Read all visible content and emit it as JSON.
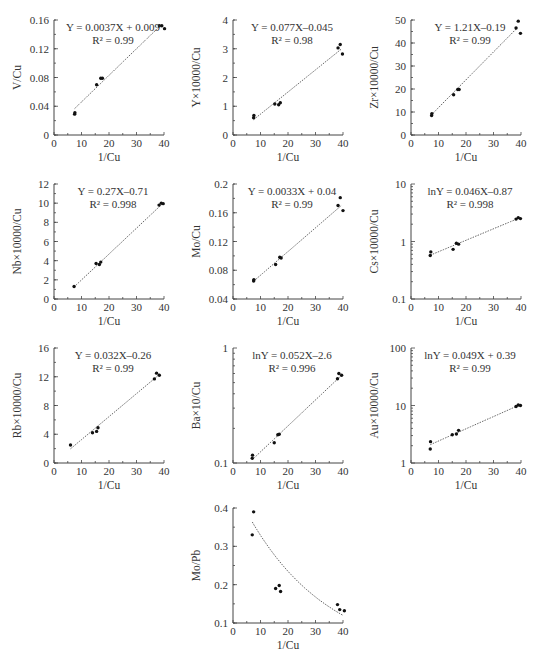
{
  "chart_data": [
    {
      "id": "v-cu",
      "type": "scatter",
      "scale": "linear",
      "xlabel": "1/Cu",
      "ylabel": "V/Cu",
      "xlim": [
        0,
        40
      ],
      "ylim": [
        0,
        0.16
      ],
      "xticks": [
        0,
        10,
        20,
        30,
        40
      ],
      "yticks": [
        0,
        0.04,
        0.08,
        0.12,
        0.16
      ],
      "ytick_labels": [
        "0",
        "0.04",
        "0.08",
        "0.12",
        "0.16"
      ],
      "equation": "Y = 0.0037X + 0.009",
      "r2": "R² = 0.99",
      "fit": {
        "kind": "linear",
        "slope": 0.0037,
        "intercept": 0.009,
        "x_range": [
          7.5,
          38.5
        ]
      },
      "points": [
        [
          7.5,
          0.029
        ],
        [
          7.6,
          0.031
        ],
        [
          15.5,
          0.07
        ],
        [
          17.0,
          0.079
        ],
        [
          17.6,
          0.079
        ],
        [
          38.3,
          0.152
        ],
        [
          39.2,
          0.152
        ],
        [
          40.2,
          0.148
        ]
      ]
    },
    {
      "id": "y-cu",
      "type": "scatter",
      "scale": "linear",
      "xlabel": "1/Cu",
      "ylabel": "Y×10000/Cu",
      "xlim": [
        0,
        40
      ],
      "ylim": [
        0,
        4
      ],
      "xticks": [
        0,
        10,
        20,
        30,
        40
      ],
      "yticks": [
        0,
        1,
        2,
        3,
        4
      ],
      "ytick_labels": [
        "0",
        "1",
        "2",
        "3",
        "4"
      ],
      "equation": "Y = 0.077X–0.045",
      "r2": "R² = 0.98",
      "fit": {
        "kind": "linear",
        "slope": 0.077,
        "intercept": -0.045,
        "x_range": [
          7.5,
          39.5
        ]
      },
      "points": [
        [
          7.5,
          0.6
        ],
        [
          7.6,
          0.68
        ],
        [
          15.2,
          1.08
        ],
        [
          16.6,
          1.05
        ],
        [
          17.2,
          1.12
        ],
        [
          38.2,
          3.03
        ],
        [
          39.0,
          3.15
        ],
        [
          39.8,
          2.82
        ]
      ]
    },
    {
      "id": "zr-cu",
      "type": "scatter",
      "scale": "linear",
      "xlabel": "1/Cu",
      "ylabel": "Zr×10000/Cu",
      "xlim": [
        0,
        40
      ],
      "ylim": [
        0,
        50
      ],
      "xticks": [
        0,
        10,
        20,
        30,
        40
      ],
      "yticks": [
        0,
        10,
        20,
        30,
        40,
        50
      ],
      "ytick_labels": [
        "0",
        "10",
        "20",
        "30",
        "40",
        "50"
      ],
      "equation": "Y = 1.21X–0.19",
      "r2": "R² = 0.99",
      "fit": {
        "kind": "linear",
        "slope": 1.21,
        "intercept": -0.19,
        "x_range": [
          7.5,
          38.5
        ]
      },
      "points": [
        [
          7.5,
          8.5
        ],
        [
          7.6,
          9.3
        ],
        [
          15.5,
          17.5
        ],
        [
          17.0,
          19.8
        ],
        [
          17.5,
          19.8
        ],
        [
          38.2,
          46.5
        ],
        [
          39.0,
          49.5
        ],
        [
          39.8,
          44.2
        ]
      ]
    },
    {
      "id": "nb-cu",
      "type": "scatter",
      "scale": "linear",
      "xlabel": "1/Cu",
      "ylabel": "Nb×10000/Cu",
      "xlim": [
        0,
        40
      ],
      "ylim": [
        0,
        12
      ],
      "xticks": [
        0,
        10,
        20,
        30,
        40
      ],
      "yticks": [
        0,
        2,
        4,
        6,
        8,
        10,
        12
      ],
      "ytick_labels": [
        "0",
        "2",
        "4",
        "6",
        "8",
        "10",
        "12"
      ],
      "equation": "Y = 0.27X–0.71",
      "r2": "R² = 0.998",
      "fit": {
        "kind": "linear",
        "slope": 0.27,
        "intercept": -0.71,
        "x_range": [
          7.3,
          39.5
        ]
      },
      "points": [
        [
          7.3,
          1.3
        ],
        [
          15.3,
          3.7
        ],
        [
          16.5,
          3.6
        ],
        [
          17.0,
          3.85
        ],
        [
          38.2,
          9.8
        ],
        [
          39.0,
          10.0
        ],
        [
          39.7,
          9.95
        ]
      ]
    },
    {
      "id": "mo-cu",
      "type": "scatter",
      "scale": "linear",
      "xlabel": "1/Cu",
      "ylabel": "Mo/Cu",
      "xlim": [
        0,
        40
      ],
      "ylim": [
        0.04,
        0.2
      ],
      "xticks": [
        0,
        10,
        20,
        30,
        40
      ],
      "yticks": [
        0.04,
        0.08,
        0.12,
        0.16,
        0.2
      ],
      "ytick_labels": [
        "0.04",
        "0.08",
        "0.12",
        "0.16",
        "0.2"
      ],
      "equation": "Y = 0.0033X + 0.04",
      "r2": "R² = 0.99",
      "fit": {
        "kind": "linear",
        "slope": 0.0033,
        "intercept": 0.04,
        "x_range": [
          7.5,
          39.5
        ]
      },
      "points": [
        [
          7.5,
          0.065
        ],
        [
          7.6,
          0.067
        ],
        [
          15.5,
          0.088
        ],
        [
          17.0,
          0.098
        ],
        [
          17.5,
          0.097
        ],
        [
          38.2,
          0.17
        ],
        [
          39.0,
          0.181
        ],
        [
          40.0,
          0.163
        ]
      ]
    },
    {
      "id": "cs-cu",
      "type": "scatter",
      "scale": "log",
      "xlabel": "1/Cu",
      "ylabel": "Cs×10000/Cu",
      "xlim": [
        0,
        40
      ],
      "ylim": [
        0.1,
        10
      ],
      "xticks": [
        0,
        10,
        20,
        30,
        40
      ],
      "yticks": [
        0.1,
        1,
        10
      ],
      "ytick_labels": [
        "0.1",
        "1",
        "10"
      ],
      "equation": "lnY = 0.046X–0.87",
      "r2": "R² = 0.998",
      "fit": {
        "kind": "exp",
        "slope": 0.046,
        "intercept": -0.87,
        "x_range": [
          7.0,
          39.5
        ]
      },
      "points": [
        [
          7.0,
          0.57
        ],
        [
          7.2,
          0.66
        ],
        [
          15.3,
          0.73
        ],
        [
          16.5,
          0.93
        ],
        [
          17.3,
          0.9
        ],
        [
          38.2,
          2.45
        ],
        [
          39.0,
          2.6
        ],
        [
          39.8,
          2.5
        ]
      ]
    },
    {
      "id": "rb-cu",
      "type": "scatter",
      "scale": "linear",
      "xlabel": "1/Cu",
      "ylabel": "Rb×10000/Cu",
      "xlim": [
        0,
        40
      ],
      "ylim": [
        0,
        16
      ],
      "xticks": [
        0,
        10,
        20,
        30,
        40
      ],
      "yticks": [
        0,
        4,
        8,
        12,
        16
      ],
      "ytick_labels": [
        "0",
        "4",
        "8",
        "12",
        "16"
      ],
      "equation": "Y = 0.032X–0.26",
      "r2": "R² = 0.99",
      "fit": {
        "kind": "linear",
        "slope": 0.32,
        "intercept": 0.05,
        "x_range": [
          6.0,
          38.5
        ]
      },
      "points": [
        [
          6.0,
          2.5
        ],
        [
          14.0,
          4.2
        ],
        [
          15.5,
          4.4
        ],
        [
          16.0,
          4.9
        ],
        [
          36.5,
          11.7
        ],
        [
          37.3,
          12.5
        ],
        [
          38.3,
          12.2
        ]
      ]
    },
    {
      "id": "ba-cu",
      "type": "scatter",
      "scale": "log",
      "xlabel": "1/Cu",
      "ylabel": "Ba×10/Cu",
      "xlim": [
        0,
        40
      ],
      "ylim": [
        0.1,
        1
      ],
      "xticks": [
        0,
        10,
        20,
        30,
        40
      ],
      "yticks": [
        0.1,
        1
      ],
      "ytick_labels": [
        "0.1",
        "1"
      ],
      "equation": "lnY = 0.052X–2.6",
      "r2": "R² = 0.996",
      "fit": {
        "kind": "exp",
        "slope": 0.052,
        "intercept": -2.6,
        "x_range": [
          7.0,
          39.5
        ]
      },
      "points": [
        [
          7.0,
          0.11
        ],
        [
          7.1,
          0.117
        ],
        [
          15.0,
          0.15
        ],
        [
          16.3,
          0.176
        ],
        [
          16.8,
          0.178
        ],
        [
          38.0,
          0.54
        ],
        [
          38.5,
          0.6
        ],
        [
          39.5,
          0.58
        ]
      ]
    },
    {
      "id": "au-cu",
      "type": "scatter",
      "scale": "log",
      "xlabel": "1/Cu",
      "ylabel": "Au×10000/Cu",
      "xlim": [
        0,
        40
      ],
      "ylim": [
        1,
        100
      ],
      "xticks": [
        0,
        10,
        20,
        30,
        40
      ],
      "yticks": [
        1,
        10,
        100
      ],
      "ytick_labels": [
        "1",
        "10",
        "100"
      ],
      "equation": "lnY = 0.049X + 0.39",
      "r2": "R² = 0.99",
      "fit": {
        "kind": "exp",
        "slope": 0.049,
        "intercept": 0.39,
        "x_range": [
          7.0,
          39.5
        ]
      },
      "points": [
        [
          7.0,
          1.75
        ],
        [
          7.1,
          2.35
        ],
        [
          15.0,
          3.1
        ],
        [
          16.5,
          3.2
        ],
        [
          17.3,
          3.7
        ],
        [
          38.2,
          9.6
        ],
        [
          39.0,
          10.2
        ],
        [
          39.8,
          10.0
        ]
      ]
    },
    {
      "id": "mo-pb",
      "type": "scatter",
      "scale": "linear",
      "xlabel": "1/Cu",
      "ylabel": "Mo/Pb",
      "xlim": [
        0,
        40
      ],
      "ylim": [
        0.1,
        0.4
      ],
      "xticks": [
        0,
        10,
        20,
        30,
        40
      ],
      "yticks": [
        0.1,
        0.2,
        0.3,
        0.4
      ],
      "ytick_labels": [
        "0.1",
        "0.2",
        "0.3",
        "0.4"
      ],
      "equation": "",
      "r2": "",
      "fit": {
        "kind": "expdecay",
        "a": 0.46,
        "b": -0.0336,
        "x_range": [
          7.0,
          40.0
        ]
      },
      "points": [
        [
          7.0,
          0.33
        ],
        [
          7.5,
          0.39
        ],
        [
          15.5,
          0.19
        ],
        [
          16.8,
          0.198
        ],
        [
          17.3,
          0.182
        ],
        [
          38.0,
          0.148
        ],
        [
          38.8,
          0.135
        ],
        [
          40.5,
          0.132
        ]
      ]
    }
  ]
}
